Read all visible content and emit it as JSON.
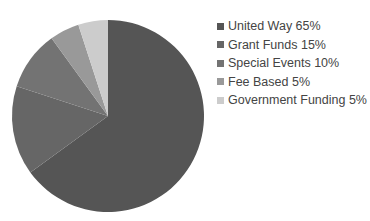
{
  "chart_data": {
    "type": "pie",
    "title": "",
    "start_angle": "12 o'clock",
    "direction": "clockwise",
    "legend_position": "right",
    "slices": [
      {
        "label": "United Way",
        "value": 65,
        "color": "#555555",
        "legend": "United Way 65%"
      },
      {
        "label": "Grant Funds",
        "value": 15,
        "color": "#666666",
        "legend": "Grant Funds 15%"
      },
      {
        "label": "Special Events",
        "value": 10,
        "color": "#737373",
        "legend": "Special Events 10%"
      },
      {
        "label": "Fee Based",
        "value": 5,
        "color": "#999999",
        "legend": "Fee Based 5%"
      },
      {
        "label": "Government Funding",
        "value": 5,
        "color": "#cccccc",
        "legend": "Government Funding 5%"
      }
    ]
  },
  "legend": {
    "items": [
      {
        "label": "United Way 65%",
        "color": "#555555"
      },
      {
        "label": "Grant Funds 15%",
        "color": "#666666"
      },
      {
        "label": "Special Events 10%",
        "color": "#737373"
      },
      {
        "label": "Fee Based 5%",
        "color": "#999999"
      },
      {
        "label": "Government Funding 5%",
        "color": "#cccccc"
      }
    ]
  }
}
